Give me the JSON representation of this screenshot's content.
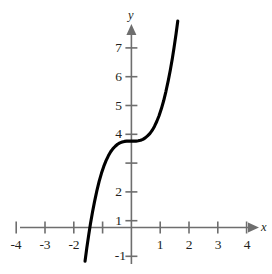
{
  "chart_data": {
    "type": "line",
    "title": "",
    "subtitle": "",
    "xlabel": "x",
    "ylabel": "y",
    "xlim": [
      -4.6,
      4.6
    ],
    "ylim": [
      -1.45,
      7.9
    ],
    "grid": false,
    "legend": null,
    "annotations": [],
    "x_ticks": [
      -4,
      -3,
      -2,
      -1,
      1,
      2,
      3,
      4
    ],
    "x_tick_labels": [
      "-4",
      "-3",
      "-2",
      "",
      "1",
      "2",
      "3",
      "4"
    ],
    "y_ticks": [
      -1,
      1,
      2,
      3,
      4,
      5,
      6,
      7
    ],
    "y_tick_labels": [
      "-1",
      "1",
      "2",
      "",
      "4",
      "5",
      "6",
      "7"
    ],
    "series": [
      {
        "name": "y = x^3 + 3",
        "color": "#000000",
        "x": [
          -1.61,
          -1.55,
          -1.48,
          -1.42,
          -1.35,
          -1.28,
          -1.2,
          -1.12,
          -1.04,
          -0.96,
          -0.88,
          -0.8,
          -0.72,
          -0.64,
          -0.56,
          -0.48,
          -0.4,
          -0.32,
          -0.24,
          -0.16,
          -0.08,
          0,
          0.08,
          0.16,
          0.24,
          0.32,
          0.4,
          0.48,
          0.56,
          0.64,
          0.72,
          0.8,
          0.88,
          0.96,
          1.04,
          1.12,
          1.2,
          1.28,
          1.35,
          1.42,
          1.48,
          1.55,
          1.61
        ],
        "y": [
          -1.17,
          -0.72,
          -0.24,
          0.14,
          0.54,
          0.9,
          1.27,
          1.6,
          1.88,
          2.12,
          2.32,
          2.49,
          2.63,
          2.74,
          2.82,
          2.89,
          2.94,
          2.97,
          2.99,
          3.0,
          3.0,
          3.0,
          3.0,
          3.0,
          3.01,
          3.03,
          3.06,
          3.11,
          3.18,
          3.26,
          3.37,
          3.51,
          3.68,
          3.88,
          4.12,
          4.4,
          4.73,
          5.1,
          5.46,
          5.86,
          6.24,
          6.72,
          7.17
        ]
      }
    ]
  },
  "axes": {
    "y_axis_label": "y",
    "x_axis_label": "x"
  },
  "x_tick_labels": [
    {
      "text": "-4",
      "value": -4
    },
    {
      "text": "-3",
      "value": -3
    },
    {
      "text": "-2",
      "value": -2
    },
    {
      "text": "1",
      "value": 1
    },
    {
      "text": "2",
      "value": 2
    },
    {
      "text": "3",
      "value": 3
    },
    {
      "text": "4",
      "value": 4
    }
  ],
  "y_tick_labels": [
    {
      "text": "7",
      "value": 7
    },
    {
      "text": "6",
      "value": 6
    },
    {
      "text": "5",
      "value": 5
    },
    {
      "text": "4",
      "value": 4
    },
    {
      "text": "2",
      "value": 2
    },
    {
      "text": "1",
      "value": 1
    },
    {
      "text": "-1",
      "value": -1
    }
  ]
}
